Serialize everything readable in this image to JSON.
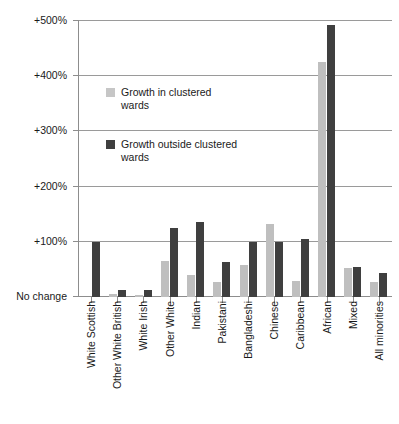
{
  "chart_data": {
    "type": "bar",
    "title": "",
    "subtitle": "",
    "xlabel": "",
    "ylabel": "",
    "grid": true,
    "legend_position": "inside-plot-upper-left",
    "ylim": [
      0,
      500
    ],
    "ytick_values": [
      500,
      400,
      300,
      200,
      100,
      0
    ],
    "ytick_labels": [
      "+500%",
      "+400%",
      "+300%",
      "+200%",
      "+100%",
      "No change"
    ],
    "categories": [
      "White Scottish",
      "Other White British",
      "White Irish",
      "Other White",
      "Indian",
      "Pakistani",
      "Bangladeshi",
      "Chinese",
      "Caribbean",
      "African",
      "Mixed",
      "All minorities"
    ],
    "series": [
      {
        "name": "Growth in clustered wards",
        "color": "#bfbfbf",
        "values": [
          0,
          5,
          3,
          65,
          40,
          27,
          58,
          133,
          29,
          425,
          53,
          27
        ]
      },
      {
        "name": "Growth outside clustered wards",
        "color": "#3f3f3f",
        "values": [
          100,
          13,
          12,
          125,
          135,
          63,
          100,
          100,
          106,
          492,
          54,
          43
        ]
      }
    ]
  },
  "legend": {
    "entries": [
      {
        "label": "Growth in clustered wards",
        "swatch": "inside"
      },
      {
        "label": "Growth outside clustered wards",
        "swatch": "outside"
      }
    ]
  },
  "colors": {
    "series_inside": "#bfbfbf",
    "series_outside": "#3f3f3f",
    "gridline": "#9a9a9a",
    "axis": "#8d8d8d",
    "background": "#ffffff",
    "text": "#1a1a1a"
  }
}
